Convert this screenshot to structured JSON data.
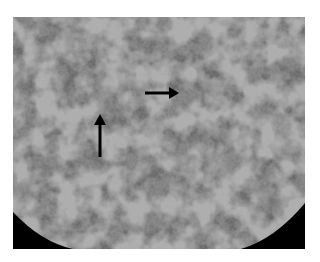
{
  "figure": {
    "type": "grayscale micrograph",
    "colors": {
      "background": "#ffffff",
      "matrix": "#6e6e6e",
      "grains": "#a8a8a8",
      "corners": "#000000",
      "arrows": "#000000"
    },
    "annotations": [
      {
        "name": "horizontal-arrow",
        "direction": "right",
        "from": [
          145,
          93
        ],
        "to": [
          178,
          93
        ]
      },
      {
        "name": "vertical-arrow",
        "direction": "up",
        "from": [
          100,
          157
        ],
        "to": [
          100,
          115
        ]
      }
    ]
  },
  "caption": {
    "text": ""
  }
}
